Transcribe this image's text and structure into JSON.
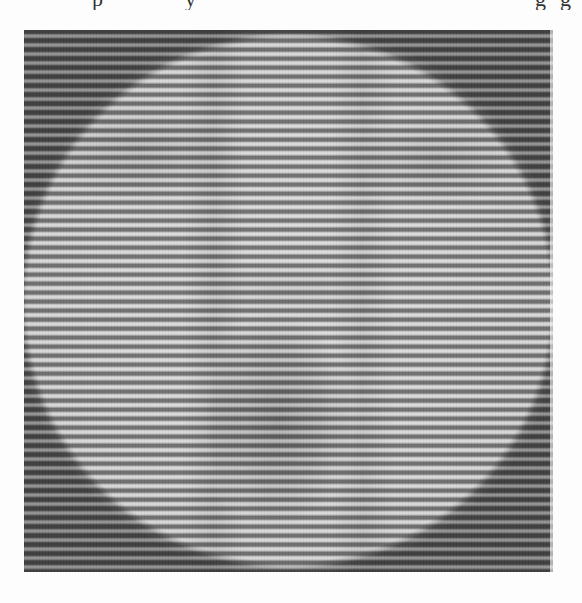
{
  "page": {
    "caption_fragment": "p , y , g g",
    "caption_fragment_parts": [
      "p",
      ",",
      "y",
      ",",
      "g",
      "g"
    ],
    "caption_cropped": true
  },
  "figure": {
    "kind": "grayscale striped image",
    "stripe_period_px": 9,
    "colors": {
      "background": "#fdfdfd",
      "light_stripe": "#e0e0e0",
      "dark_stripe": "#5a5a5a",
      "corner_shade": "#6e6e6e"
    }
  }
}
